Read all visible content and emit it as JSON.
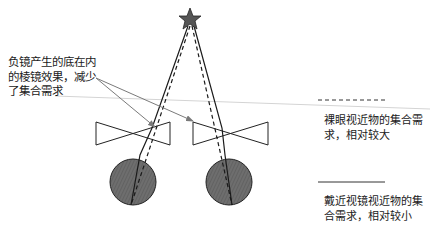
{
  "annotation": {
    "lines": [
      "负镜产生的底在内",
      "的棱镜效果，减少",
      "了集合需求"
    ]
  },
  "legend": {
    "dashed": {
      "lines": [
        "裸眼视近物的集合需",
        "求，相对较大"
      ],
      "style": "dashed"
    },
    "solid": {
      "lines": [
        "戴近视镜视近物的集",
        "合需求，相对较小"
      ],
      "style": "solid"
    }
  },
  "elements": {
    "object": "star-icon",
    "lenses": [
      "left-concave-lens",
      "right-concave-lens"
    ],
    "eyes": [
      "left-eye",
      "right-eye"
    ]
  },
  "colors": {
    "line": "#1a1a1a",
    "star_fill": "#555555",
    "eye_fill": "#6a6a6a",
    "arrow": "#7a7a7a",
    "guide_line": "#d0d0d0"
  }
}
